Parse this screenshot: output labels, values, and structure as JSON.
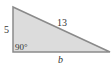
{
  "diagram": {
    "type": "right-triangle",
    "fill_color": "#dcdcdc",
    "stroke_color": "#8a8a8a",
    "vertices": {
      "top_left": [
        13,
        7
      ],
      "bottom_left": [
        13,
        52
      ],
      "bottom_right": [
        110,
        52
      ]
    },
    "labels": {
      "left_leg": "5",
      "hypotenuse": "13",
      "right_angle": "90°",
      "base": "b"
    }
  }
}
